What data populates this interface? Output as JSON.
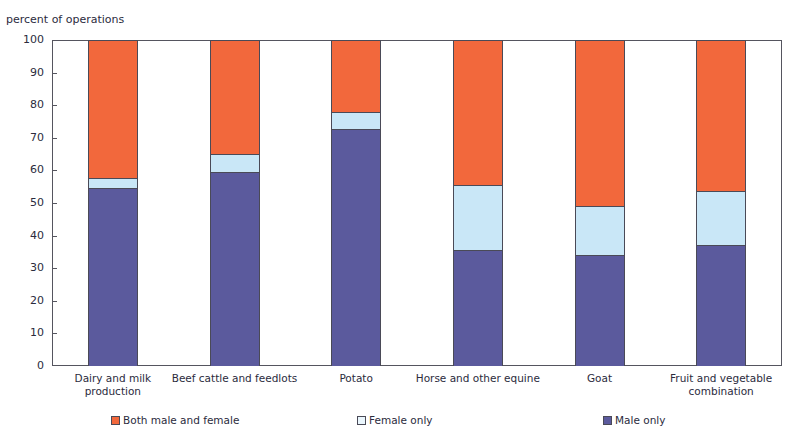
{
  "title_faint": "",
  "axis_title": "percent of operations",
  "legend": {
    "items": [
      {
        "label": "Both male and female",
        "key": "both",
        "color": "#f2683c",
        "icon": "square-swatch-icon"
      },
      {
        "label": "Female only",
        "key": "female",
        "color": "#c9e7f7",
        "icon": "square-swatch-icon"
      },
      {
        "label": "Male only",
        "key": "male",
        "color": "#5b5a9d",
        "icon": "square-swatch-icon"
      }
    ]
  },
  "chart_data": {
    "type": "bar",
    "stacked": true,
    "title": "",
    "xlabel": "",
    "ylabel": "percent of operations",
    "ylim": [
      0,
      100
    ],
    "ytick_step": 10,
    "yticks": [
      100,
      90,
      80,
      70,
      60,
      50,
      40,
      30,
      20,
      10,
      0
    ],
    "grid": false,
    "legend_position": "bottom",
    "categories": [
      "Dairy and milk production",
      "Beef cattle and feedlots",
      "Potato",
      "Horse and other equine",
      "Goat",
      "Fruit and vegetable combination"
    ],
    "series": [
      {
        "name": "Male only",
        "color": "#5b5a9d",
        "values": [
          54.6,
          59.5,
          72.7,
          35.6,
          34.0,
          37.1
        ]
      },
      {
        "name": "Female only",
        "color": "#c9e7f7",
        "values": [
          3.1,
          5.5,
          5.3,
          19.9,
          15.0,
          16.6
        ]
      },
      {
        "name": "Both male and female",
        "color": "#f2683c",
        "values": [
          42.3,
          35.0,
          22.0,
          44.5,
          51.0,
          46.3
        ]
      }
    ],
    "cumulative_tops": [
      {
        "category": "Dairy and milk production",
        "male_only": 54.6,
        "male_plus_female": 57.7,
        "total": 100
      },
      {
        "category": "Beef cattle and feedlots",
        "male_only": 59.5,
        "male_plus_female": 65.0,
        "total": 100
      },
      {
        "category": "Potato",
        "male_only": 72.7,
        "male_plus_female": 78.0,
        "total": 100
      },
      {
        "category": "Horse and other equine",
        "male_only": 35.6,
        "male_plus_female": 55.5,
        "total": 100
      },
      {
        "category": "Goat",
        "male_only": 34.0,
        "male_plus_female": 49.0,
        "total": 100
      },
      {
        "category": "Fruit and vegetable combination",
        "male_only": 37.1,
        "male_plus_female": 53.7,
        "total": 100
      }
    ]
  }
}
